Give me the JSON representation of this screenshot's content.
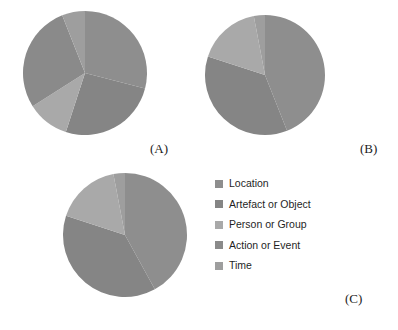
{
  "figure": {
    "panel_labels": [
      {
        "text": "(A)",
        "x": 150,
        "y": 141
      },
      {
        "text": "(B)",
        "x": 360,
        "y": 141
      },
      {
        "text": "(C)",
        "x": 345,
        "y": 291
      }
    ]
  },
  "legend": {
    "position": "right-middle",
    "items": [
      {
        "label": "Location",
        "color": "#8e8e8e"
      },
      {
        "label": "Artefact or Object",
        "color": "#858585"
      },
      {
        "label": "Person or Group",
        "color": "#a9a9a9"
      },
      {
        "label": "Action or Event",
        "color": "#8a8a8a"
      },
      {
        "label": "Time",
        "color": "#9e9e9e"
      }
    ]
  },
  "chart_data": [
    {
      "type": "pie",
      "title": "(A)",
      "categories": [
        "Location",
        "Artefact or Object",
        "Person or Group",
        "Action or Event",
        "Time"
      ],
      "values": [
        29,
        26,
        11,
        28,
        6
      ],
      "colors": [
        "#8e8e8e",
        "#858585",
        "#a9a9a9",
        "#8a8a8a",
        "#9e9e9e"
      ],
      "start_angle": 0,
      "geometry": {
        "cx": 85,
        "cy": 73,
        "r": 62
      }
    },
    {
      "type": "pie",
      "title": "(B)",
      "categories": [
        "Location",
        "Artefact or Object",
        "Person or Group",
        "Action or Event",
        "Time"
      ],
      "values": [
        44,
        36,
        17,
        0,
        3
      ],
      "colors": [
        "#8e8e8e",
        "#858585",
        "#a9a9a9",
        "#8a8a8a",
        "#9e9e9e"
      ],
      "start_angle": 0,
      "geometry": {
        "cx": 265,
        "cy": 75,
        "r": 60
      }
    },
    {
      "type": "pie",
      "title": "(C)",
      "categories": [
        "Location",
        "Artefact or Object",
        "Person or Group",
        "Action or Event",
        "Time"
      ],
      "values": [
        42,
        38,
        17,
        0,
        3
      ],
      "colors": [
        "#8e8e8e",
        "#858585",
        "#a9a9a9",
        "#8a8a8a",
        "#9e9e9e"
      ],
      "start_angle": 0,
      "geometry": {
        "cx": 125,
        "cy": 235,
        "r": 62
      }
    }
  ]
}
